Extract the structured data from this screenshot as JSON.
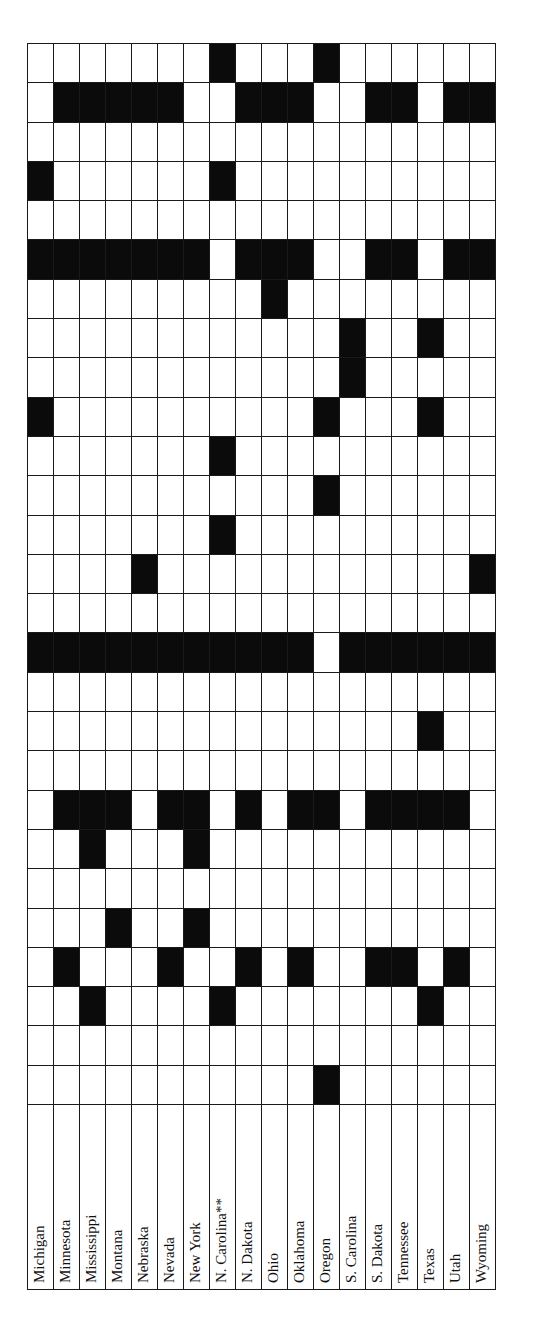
{
  "table": {
    "columns": [
      "Michigan",
      "Minnesota",
      "Mississippi",
      "Montana",
      "Nebraska",
      "Nevada",
      "New York",
      "N. Carolina**",
      "N. Dakota",
      "Ohio",
      "Oklahoma",
      "Oregon",
      "S. Carolina",
      "S. Dakota",
      "Tennessee",
      "Texas",
      "Utah",
      "Wyoming"
    ],
    "row_count": 27,
    "filled_cells": [
      [
        7,
        11
      ],
      [
        1,
        2,
        3,
        4,
        5,
        8,
        9,
        10,
        13,
        14,
        16,
        17
      ],
      [],
      [
        0,
        7
      ],
      [],
      [
        0,
        1,
        2,
        3,
        4,
        5,
        6,
        8,
        9,
        10,
        13,
        14,
        16,
        17
      ],
      [
        9
      ],
      [
        12,
        15
      ],
      [
        12
      ],
      [
        0,
        11,
        15
      ],
      [
        7
      ],
      [
        11
      ],
      [
        7
      ],
      [
        4,
        17
      ],
      [],
      [
        0,
        1,
        2,
        3,
        4,
        5,
        6,
        7,
        8,
        9,
        10,
        12,
        13,
        14,
        15,
        16,
        17
      ],
      [],
      [
        15
      ],
      [],
      [
        1,
        2,
        3,
        5,
        6,
        8,
        10,
        11,
        13,
        14,
        15,
        16
      ],
      [
        2,
        6
      ],
      [],
      [
        3,
        6
      ],
      [
        1,
        5,
        8,
        10,
        13,
        14,
        16
      ],
      [
        2,
        7,
        15
      ],
      [],
      [
        11
      ]
    ]
  },
  "colors": {
    "filled": "#0b0b0b",
    "empty": "#ffffff",
    "line": "#1a1a1a"
  }
}
